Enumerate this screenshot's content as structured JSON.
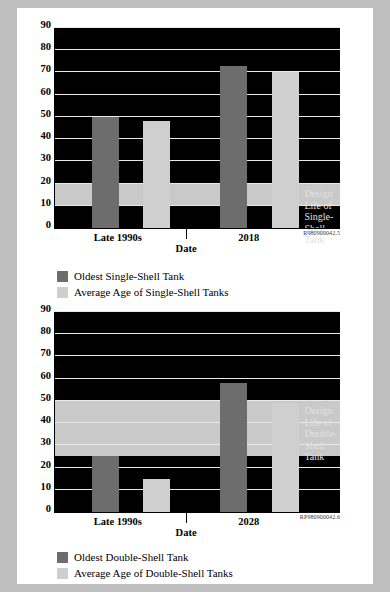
{
  "document_id_top": "R980900042.5",
  "document_id_bottom": "RP980900042.6",
  "charts": [
    {
      "id": "single-shell",
      "ylabel": "Age of Tanks (Years)",
      "xlabel": "Date",
      "yticks": [
        0,
        10,
        20,
        30,
        40,
        50,
        60,
        70,
        80,
        90
      ],
      "ylim": [
        0,
        90
      ],
      "band": {
        "from": 10,
        "to": 20,
        "label": "Design Life of\nSingle-Shell Tank"
      },
      "xticks": [
        {
          "label": "Late 1990s",
          "pos": 22
        },
        {
          "label": "2018",
          "pos": 68
        }
      ],
      "bars": [
        {
          "name": "Oldest Single-Shell Tank",
          "series": "oldest",
          "value": 50,
          "x": 13,
          "width": 9.5
        },
        {
          "name": "Average Age of Single-Shell Tanks",
          "series": "average",
          "value": 48,
          "x": 31,
          "width": 9.5
        },
        {
          "name": "Oldest Single-Shell Tank",
          "series": "oldest",
          "value": 73,
          "x": 58,
          "width": 9.5
        },
        {
          "name": "Average Age of Single-Shell Tanks",
          "series": "average",
          "value": 70,
          "x": 76,
          "width": 9.5
        }
      ],
      "legend": [
        {
          "series": "oldest",
          "label": "Oldest Single-Shell Tank"
        },
        {
          "series": "average",
          "label": "Average Age of Single-Shell Tanks"
        }
      ]
    },
    {
      "id": "double-shell",
      "ylabel": "Age of Tanks (Years)",
      "xlabel": "Date",
      "yticks": [
        0,
        10,
        20,
        30,
        40,
        50,
        60,
        70,
        80,
        90
      ],
      "ylim": [
        0,
        90
      ],
      "band": {
        "from": 25,
        "to": 50,
        "label": "Design Life of\nDouble-Shell\nTank"
      },
      "xticks": [
        {
          "label": "Late 1990s",
          "pos": 22
        },
        {
          "label": "2028",
          "pos": 68
        }
      ],
      "bars": [
        {
          "name": "Oldest Double-Shell Tank",
          "series": "oldest",
          "value": 25,
          "x": 13,
          "width": 9.5
        },
        {
          "name": "Average Age of Double-Shell Tanks",
          "series": "average",
          "value": 15,
          "x": 31,
          "width": 9.5
        },
        {
          "name": "Oldest Double-Shell Tank",
          "series": "oldest",
          "value": 58,
          "x": 58,
          "width": 9.5
        },
        {
          "name": "Average Age of Double-Shell Tanks",
          "series": "average",
          "value": 49,
          "x": 76,
          "width": 9.5
        }
      ],
      "legend": [
        {
          "series": "oldest",
          "label": "Oldest Double-Shell Tank"
        },
        {
          "series": "average",
          "label": "Average Age of Double-Shell Tanks"
        }
      ]
    }
  ],
  "chart_data": [
    {
      "type": "bar",
      "title": "Oldest and Average Age of Single-Shell Tanks vs. Design Life",
      "xlabel": "Date",
      "ylabel": "Age of Tanks (Years)",
      "ylim": [
        0,
        90
      ],
      "yticks": [
        0,
        10,
        20,
        30,
        40,
        50,
        60,
        70,
        80,
        90
      ],
      "categories": [
        "Late 1990s",
        "2018"
      ],
      "series": [
        {
          "name": "Oldest Single-Shell Tank",
          "values": [
            50,
            73
          ],
          "color": "#6d6d6d"
        },
        {
          "name": "Average Age of Single-Shell Tanks",
          "values": [
            48,
            70
          ],
          "color": "#cfcfcf"
        }
      ],
      "annotations": [
        {
          "text": "Design Life of Single-Shell Tank",
          "type": "hband",
          "from": 10,
          "to": 20,
          "color": "#c9c9c9"
        }
      ],
      "grid": true,
      "legend_position": "below",
      "figure_id": "R980900042.5"
    },
    {
      "type": "bar",
      "title": "Oldest and Average Age of Double-Shell Tanks vs. Design Life",
      "xlabel": "Date",
      "ylabel": "Age of Tanks (Years)",
      "ylim": [
        0,
        90
      ],
      "yticks": [
        0,
        10,
        20,
        30,
        40,
        50,
        60,
        70,
        80,
        90
      ],
      "categories": [
        "Late 1990s",
        "2028"
      ],
      "series": [
        {
          "name": "Oldest Double-Shell Tank",
          "values": [
            25,
            58
          ],
          "color": "#6d6d6d"
        },
        {
          "name": "Average Age of Double-Shell Tanks",
          "values": [
            15,
            49
          ],
          "color": "#cfcfcf"
        }
      ],
      "annotations": [
        {
          "text": "Design Life of Double-Shell Tank",
          "type": "hband",
          "from": 25,
          "to": 50,
          "color": "#c9c9c9"
        }
      ],
      "grid": true,
      "legend_position": "below",
      "figure_id": "RP980900042.6"
    }
  ]
}
